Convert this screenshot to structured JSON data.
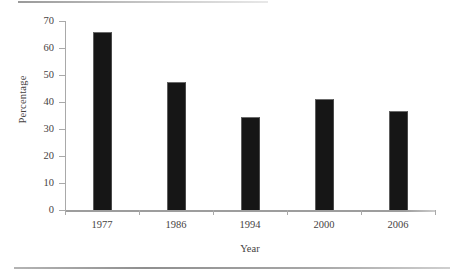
{
  "chart_data": {
    "type": "bar",
    "title": "",
    "subtitle": "",
    "xlabel": "Year",
    "ylabel": "Percentage",
    "categories": [
      "1977",
      "1986",
      "1994",
      "2000",
      "2006"
    ],
    "values": [
      66,
      47.5,
      34.5,
      41,
      36.5
    ],
    "ylim": [
      0,
      70
    ],
    "yticks": [
      "0",
      "10",
      "20",
      "30",
      "40",
      "50",
      "60",
      "70"
    ],
    "ytick_values": [
      0,
      10,
      20,
      30,
      40,
      50,
      60,
      70
    ],
    "grid": false,
    "legend": null,
    "series": [
      {
        "name": "Percentage",
        "values": [
          66,
          47.5,
          34.5,
          41,
          36.5
        ],
        "color": "#161616"
      }
    ],
    "annotations": []
  },
  "figure": {
    "bar_color": "#161616",
    "axis_color": "#a9a9a9",
    "text_color": "#46423f",
    "background": "#ffffff"
  }
}
